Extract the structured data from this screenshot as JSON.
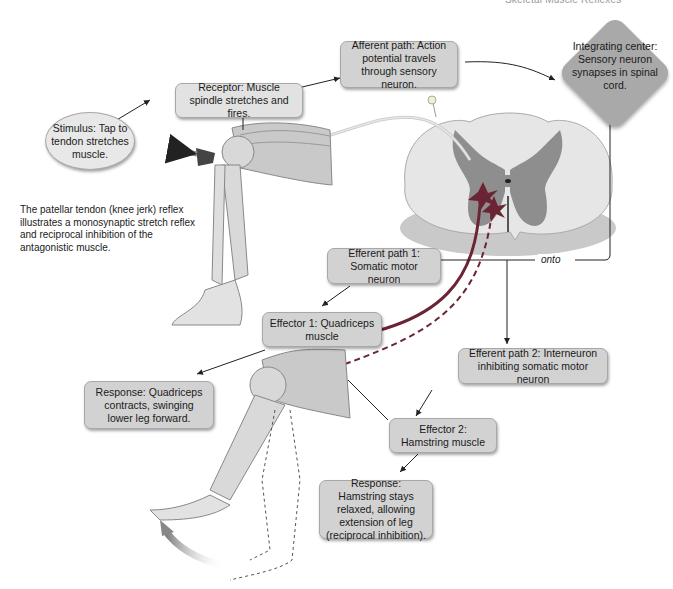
{
  "header": {
    "title": "Skeletal Muscle Reflexes"
  },
  "caption": "The patellar tendon (knee jerk) reflex illustrates a monosynaptic stretch reflex and reciprocal inhibition of the antagonistic muscle.",
  "nodes": {
    "stimulus": "Stimulus: Tap to tendon stretches muscle.",
    "receptor": "Receptor: Muscle spindle stretches and fires.",
    "afferent": "Afferent path: Action potential travels through sensory neuron.",
    "integrating": "Integrating center: Sensory neuron synapses in spinal cord.",
    "efferent1": "Efferent path 1: Somatic motor neuron",
    "effector1": "Effector 1: Quadriceps muscle",
    "response1": "Response: Quadriceps contracts, swinging lower leg forward.",
    "efferent2": "Efferent path 2: Interneuron inhibiting somatic motor neuron",
    "effector2": "Effector 2: Hamstring muscle",
    "response2": "Response: Hamstring stays relaxed, allowing extension of leg (reciprocal inhibition)."
  },
  "labels": {
    "onto": "onto"
  },
  "colors": {
    "box": "#d2d2d2",
    "integrating": "#a9a9a9",
    "neuron_red": "#7a2e3a",
    "grey_matter": "#8e8e8e",
    "white_matter": "#e6e6e6"
  }
}
